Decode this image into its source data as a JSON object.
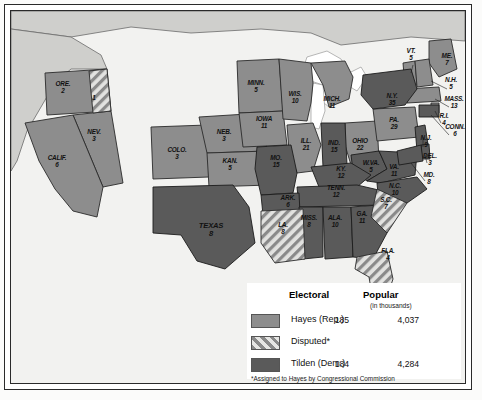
{
  "map": {
    "title": "Election of 1876 electoral map",
    "colors": {
      "hayes": "#8d8d8d",
      "tilden": "#5a5a5a",
      "disputed_base": "#d9d9d7",
      "disputed_stripe": "#7d7d7d",
      "water": "#ffffff",
      "land_outside": "#cfcfcc",
      "background": "#f2f2f0",
      "border": "#2a2a2a"
    },
    "states": [
      {
        "abbr": "ORE.",
        "votes": "2",
        "party": "hayes",
        "x": 52,
        "y": 78
      },
      {
        "abbr": "",
        "votes": "1",
        "party": "disputed",
        "x": 83,
        "y": 92
      },
      {
        "abbr": "NEV.",
        "votes": "3",
        "party": "hayes",
        "x": 83,
        "y": 126
      },
      {
        "abbr": "CALIF.",
        "votes": "6",
        "party": "hayes",
        "x": 46,
        "y": 152
      },
      {
        "abbr": "COLO.",
        "votes": "3",
        "party": "hayes",
        "x": 166,
        "y": 144
      },
      {
        "abbr": "NEB.",
        "votes": "3",
        "party": "hayes",
        "x": 213,
        "y": 126
      },
      {
        "abbr": "KAN.",
        "votes": "5",
        "party": "hayes",
        "x": 219,
        "y": 155
      },
      {
        "abbr": "TEXAS",
        "votes": "8",
        "party": "tilden",
        "x": 200,
        "y": 219
      },
      {
        "abbr": "MINN.",
        "votes": "5",
        "party": "hayes",
        "x": 245,
        "y": 77
      },
      {
        "abbr": "IOWA",
        "votes": "11",
        "party": "hayes",
        "x": 253,
        "y": 113
      },
      {
        "abbr": "WIS.",
        "votes": "10",
        "party": "hayes",
        "x": 284,
        "y": 88
      },
      {
        "abbr": "MICH.",
        "votes": "11",
        "party": "hayes",
        "x": 321,
        "y": 93
      },
      {
        "abbr": "MO.",
        "votes": "15",
        "party": "tilden",
        "x": 265,
        "y": 152
      },
      {
        "abbr": "ILL.",
        "votes": "21",
        "party": "hayes",
        "x": 295,
        "y": 135
      },
      {
        "abbr": "IND.",
        "votes": "15",
        "party": "tilden",
        "x": 323,
        "y": 137
      },
      {
        "abbr": "OHIO",
        "votes": "22",
        "party": "hayes",
        "x": 349,
        "y": 135
      },
      {
        "abbr": "PA.",
        "votes": "29",
        "party": "hayes",
        "x": 383,
        "y": 114
      },
      {
        "abbr": "N.Y.",
        "votes": "35",
        "party": "tilden",
        "x": 381,
        "y": 90
      },
      {
        "abbr": "W.VA.",
        "votes": "5",
        "party": "tilden",
        "x": 360,
        "y": 157
      },
      {
        "abbr": "VA.",
        "votes": "11",
        "party": "tilden",
        "x": 383,
        "y": 161
      },
      {
        "abbr": "KY.",
        "votes": "12",
        "party": "tilden",
        "x": 330,
        "y": 163
      },
      {
        "abbr": "TENN.",
        "votes": "12",
        "party": "tilden",
        "x": 325,
        "y": 182
      },
      {
        "abbr": "N.C.",
        "votes": "10",
        "party": "tilden",
        "x": 384,
        "y": 180
      },
      {
        "abbr": "ARK.",
        "votes": "6",
        "party": "tilden",
        "x": 277,
        "y": 192
      },
      {
        "abbr": "MISS.",
        "votes": "8",
        "party": "tilden",
        "x": 298,
        "y": 212
      },
      {
        "abbr": "ALA.",
        "votes": "10",
        "party": "tilden",
        "x": 324,
        "y": 212
      },
      {
        "abbr": "GA.",
        "votes": "11",
        "party": "tilden",
        "x": 351,
        "y": 208
      },
      {
        "abbr": "LA.",
        "votes": "8",
        "party": "disputed",
        "x": 272,
        "y": 219
      },
      {
        "abbr": "S.C.",
        "votes": "7",
        "party": "disputed",
        "x": 375,
        "y": 194
      },
      {
        "abbr": "FLA.",
        "votes": "4",
        "party": "disputed",
        "x": 377,
        "y": 245
      },
      {
        "abbr": "VT.",
        "votes": "5",
        "party": "hayes",
        "x": 400,
        "y": 45
      },
      {
        "abbr": "ME.",
        "votes": "7",
        "party": "hayes",
        "x": 436,
        "y": 50
      },
      {
        "abbr": "N.H.",
        "votes": "5",
        "party": "hayes",
        "x": 440,
        "y": 74
      },
      {
        "abbr": "MASS.",
        "votes": "13",
        "party": "hayes",
        "x": 443,
        "y": 93
      },
      {
        "abbr": "R.I.",
        "votes": "4",
        "party": "hayes",
        "x": 433,
        "y": 110
      },
      {
        "abbr": "CONN.",
        "votes": "6",
        "party": "tilden",
        "x": 444,
        "y": 121
      },
      {
        "abbr": "N.J.",
        "votes": "9",
        "party": "tilden",
        "x": 415,
        "y": 132
      },
      {
        "abbr": "DEL.",
        "votes": "3",
        "party": "tilden",
        "x": 419,
        "y": 150
      },
      {
        "abbr": "MD.",
        "votes": "8",
        "party": "tilden",
        "x": 418,
        "y": 169
      }
    ]
  },
  "legend": {
    "col_electoral": "Electoral",
    "col_popular": "Popular",
    "popular_sub": "(in thousands)",
    "rows": [
      {
        "label": "Hayes (Rep.)",
        "swatch": "hayes",
        "electoral": "185",
        "popular": "4,037"
      },
      {
        "label": "Disputed*",
        "swatch": "disputed",
        "electoral": "",
        "popular": ""
      },
      {
        "label": "Tilden (Dem.)",
        "swatch": "tilden",
        "electoral": "184",
        "popular": "4,284"
      }
    ],
    "footnote": "*Assigned to Hayes by Congressional Commission"
  }
}
